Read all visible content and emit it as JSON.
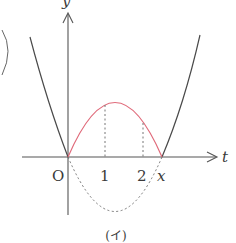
{
  "figure": {
    "caption": "(イ)",
    "colors": {
      "axis": "#555555",
      "curve": "#4a4a4a",
      "highlight": "#e06a7a",
      "dashed": "#777777",
      "text": "#3a3a3a"
    },
    "axes": {
      "x_label": "t",
      "y_label": "y",
      "origin_label": "O"
    },
    "ticks": [
      {
        "label": "1"
      },
      {
        "label": "2"
      },
      {
        "label": "x"
      }
    ]
  }
}
